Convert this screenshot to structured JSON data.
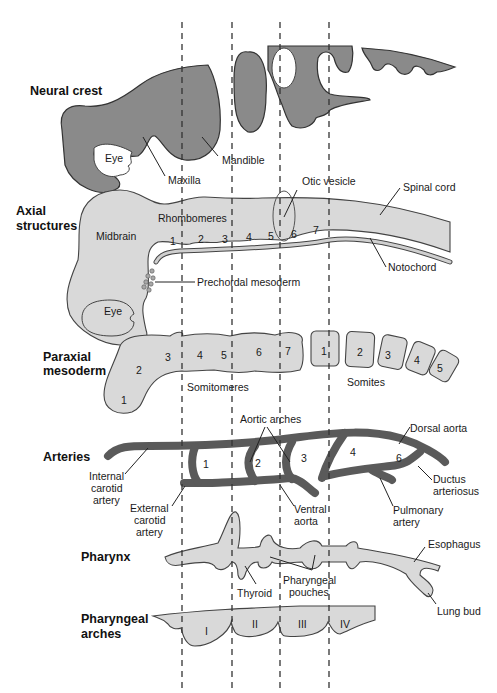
{
  "sections": {
    "neural_crest": "Neural crest",
    "axial_1": "Axial",
    "axial_2": "structures",
    "paraxial_1": "Paraxial",
    "paraxial_2": "mesoderm",
    "arteries": "Arteries",
    "pharynx": "Pharynx",
    "pharyngeal_1": "Pharyngeal",
    "pharyngeal_2": "arches"
  },
  "neural_crest": {
    "eye": "Eye",
    "maxilla": "Maxilla",
    "mandible": "Mandible"
  },
  "axial": {
    "otic_vesicle": "Otic vesicle",
    "spinal_cord": "Spinal cord",
    "rhombomeres": "Rhombomeres",
    "midbrain": "Midbrain",
    "rhombomere_numbers": [
      "1",
      "2",
      "3",
      "4",
      "5",
      "6",
      "7"
    ],
    "notochord": "Notochord",
    "prechordal": "Prechordal mesoderm",
    "eye": "Eye"
  },
  "paraxial": {
    "somitomere_numbers": [
      "1",
      "2",
      "3",
      "4",
      "5",
      "6",
      "7"
    ],
    "somitomeres": "Somitomeres",
    "somite_numbers": [
      "1",
      "2",
      "3",
      "4",
      "5"
    ],
    "somites": "Somites"
  },
  "arteries": {
    "aortic_arches": "Aortic arches",
    "dorsal_aorta": "Dorsal aorta",
    "internal_1": "Internal",
    "internal_2": "carotid",
    "internal_3": "artery",
    "external_1": "External",
    "external_2": "carotid",
    "external_3": "artery",
    "arch_numbers": [
      "1",
      "2",
      "3",
      "4",
      "6"
    ],
    "ventral_1": "Ventral",
    "ventral_2": "aorta",
    "ductus_1": "Ductus",
    "ductus_2": "arteriosus",
    "pulmonary_1": "Pulmonary",
    "pulmonary_2": "artery"
  },
  "pharynx": {
    "esophagus": "Esophagus",
    "thyroid": "Thyroid",
    "pouches_1": "Pharyngeal",
    "pouches_2": "pouches",
    "lung_bud": "Lung bud"
  },
  "pharyngeal_arches": {
    "numerals": [
      "I",
      "II",
      "III",
      "IV"
    ]
  },
  "colors": {
    "dark_fill": "#8a8a8a",
    "light_fill": "#d9d9d9",
    "artery": "#5a5a5a"
  }
}
